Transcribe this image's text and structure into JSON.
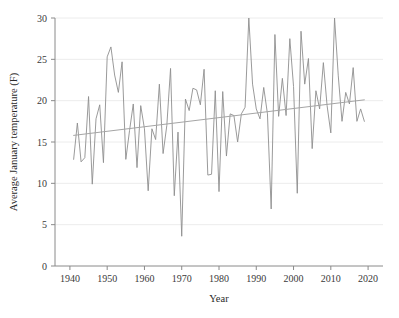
{
  "chart_data": {
    "type": "line",
    "title": "",
    "xlabel": "Year",
    "ylabel": "Average January temperature (F)",
    "xlim": [
      1936,
      2024
    ],
    "ylim": [
      0,
      30
    ],
    "xticks": [
      1940,
      1950,
      1960,
      1970,
      1980,
      1990,
      2000,
      2010,
      2020
    ],
    "yticks": [
      0,
      5,
      10,
      15,
      20,
      25,
      30
    ],
    "grid": "horizontal",
    "legend": "none",
    "line_color": "#8e8e8e",
    "trend_color": "#a5a5a5",
    "series": [
      {
        "name": "Average January temperature",
        "x": [
          1941,
          1942,
          1943,
          1944,
          1945,
          1946,
          1947,
          1948,
          1949,
          1950,
          1951,
          1952,
          1953,
          1954,
          1955,
          1956,
          1957,
          1958,
          1959,
          1960,
          1961,
          1962,
          1963,
          1964,
          1965,
          1966,
          1967,
          1968,
          1969,
          1970,
          1971,
          1972,
          1973,
          1974,
          1975,
          1976,
          1977,
          1978,
          1979,
          1980,
          1981,
          1982,
          1983,
          1984,
          1985,
          1986,
          1987,
          1988,
          1989,
          1990,
          1991,
          1992,
          1993,
          1994,
          1995,
          1996,
          1997,
          1998,
          1999,
          2000,
          2001,
          2002,
          2003,
          2004,
          2005,
          2006,
          2007,
          2008,
          2009,
          2010,
          2011,
          2012,
          2013,
          2014,
          2015,
          2016,
          2017,
          2018,
          2019
        ],
        "values": [
          12.9,
          17.3,
          12.6,
          13.1,
          20.5,
          9.9,
          17.8,
          19.5,
          12.5,
          25.3,
          26.5,
          23.1,
          21.0,
          24.7,
          12.9,
          16.4,
          19.6,
          11.9,
          19.4,
          16.6,
          9.1,
          16.6,
          15.3,
          22.0,
          13.6,
          17.0,
          23.9,
          8.5,
          16.2,
          3.6,
          20.2,
          18.8,
          21.5,
          21.3,
          19.5,
          23.8,
          11.0,
          11.1,
          21.2,
          9.0,
          21.1,
          13.3,
          18.4,
          18.2,
          15.0,
          18.4,
          19.2,
          30.0,
          22.0,
          19.0,
          17.8,
          21.6,
          18.4,
          6.9,
          28.0,
          18.1,
          22.7,
          18.2,
          27.5,
          21.7,
          8.8,
          28.4,
          22.0,
          25.1,
          14.2,
          21.2,
          19.0,
          24.6,
          19.4,
          16.1,
          30.0,
          23.0,
          17.5,
          21.0,
          19.6,
          24.0,
          17.5,
          19.0,
          17.5
        ]
      }
    ],
    "trend": {
      "name": "Linear trend",
      "x": [
        1941,
        2019
      ],
      "values": [
        15.8,
        20.1
      ]
    }
  },
  "axis": {
    "x_tick_labels": [
      "1940",
      "1950",
      "1960",
      "1970",
      "1980",
      "1990",
      "2000",
      "2010",
      "2020"
    ],
    "y_tick_labels": [
      "0",
      "5",
      "10",
      "15",
      "20",
      "25",
      "30"
    ],
    "x_title": "Year",
    "y_title": "Average January temperature (F)"
  }
}
